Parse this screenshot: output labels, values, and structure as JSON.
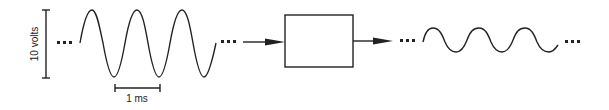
{
  "diagram": {
    "amplitude_label": "10 volts",
    "time_label": "1 ms",
    "continuation": "...",
    "input_signal": {
      "type": "sine",
      "cycles": 3,
      "amplitude_px": 34
    },
    "output_signal": {
      "type": "sine",
      "cycles": 3,
      "amplitude_px": 12
    },
    "system_block": {
      "label": ""
    },
    "colors": {
      "stroke": "#222222",
      "background": "#ffffff"
    }
  }
}
